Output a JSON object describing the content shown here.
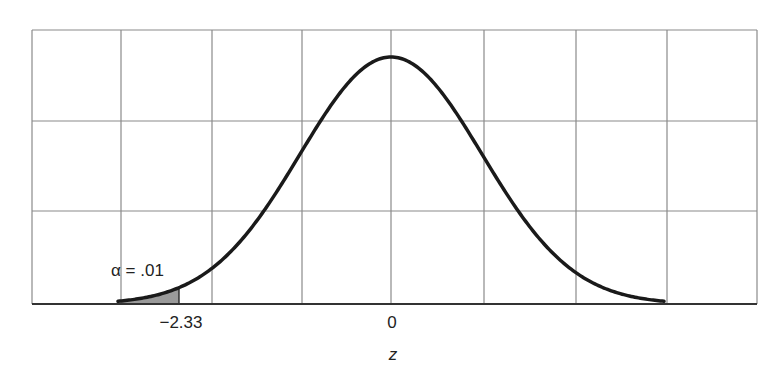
{
  "chart_data": {
    "type": "area",
    "title": "",
    "xlabel": "z",
    "ylabel": "",
    "distribution": "standard normal",
    "x_range": [
      -3,
      3
    ],
    "tick_labels": [
      {
        "value": -2.33,
        "label": "−2.33"
      },
      {
        "value": 0,
        "label": "0"
      }
    ],
    "shaded_region": {
      "from": -3,
      "to": -2.33,
      "tail": "left"
    },
    "annotation": {
      "text": "α = .01",
      "position": "above left tail"
    },
    "grid": {
      "vertical_lines": 9,
      "horizontal_lines": 4,
      "on": true
    },
    "colors": {
      "curve": "#1a1a1a",
      "grid": "#8a8a8a",
      "shade": "#9a9a9a"
    }
  },
  "labels": {
    "alpha": "α = .01",
    "critical": "−2.33",
    "zero": "0",
    "axis": "z"
  }
}
